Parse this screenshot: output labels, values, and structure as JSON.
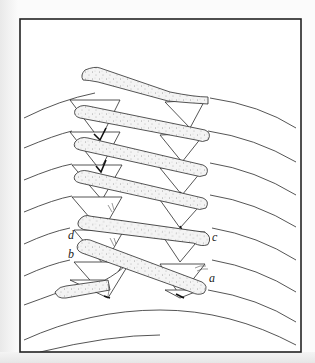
{
  "figure": {
    "labels": [
      {
        "id": "a",
        "text": "a"
      },
      {
        "id": "b",
        "text": "b"
      },
      {
        "id": "c",
        "text": "c"
      },
      {
        "id": "d",
        "text": "d"
      }
    ],
    "colors": {
      "frame": "#222222",
      "line": "#2a2a2a",
      "band_fill": "#f2f2f2",
      "stipple": "#555555",
      "background": "#ffffff"
    }
  }
}
